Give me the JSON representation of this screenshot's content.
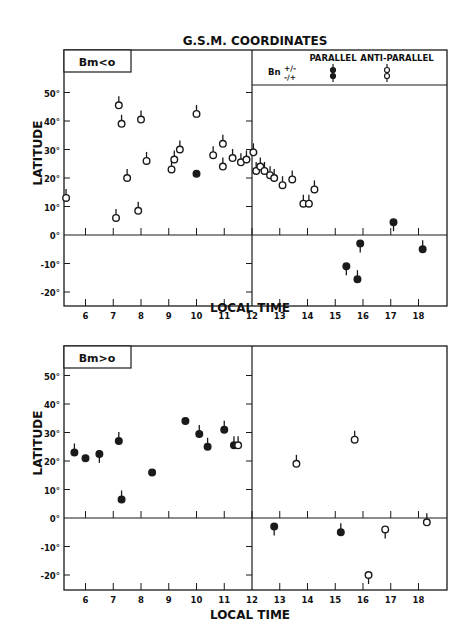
{
  "title": "G.S.M. COORDINATES",
  "legend": {
    "header_parallel": "PARALLEL",
    "header_antiparallel": "ANTI-PARALLEL",
    "bn_label": "Bn",
    "row1_sign": "+/-",
    "row2_sign": "-/+"
  },
  "chart_data": [
    {
      "type": "scatter",
      "panel_label": "Bm < o",
      "xlabel": "LOCAL TIME",
      "ylabel": "LATITUDE",
      "xlim": [
        5.2,
        19.0
      ],
      "ylim": [
        -25,
        58
      ],
      "xticks": [
        6,
        7,
        8,
        9,
        10,
        11,
        12,
        13,
        14,
        15,
        16,
        17,
        18
      ],
      "yticks": [
        50,
        40,
        30,
        20,
        10,
        0,
        -10,
        -20
      ],
      "ytick_labels": [
        "50°",
        "40°",
        "30°",
        "20°",
        "10°",
        "0°",
        "-10°",
        "-20°"
      ],
      "grid": false,
      "series": [
        {
          "name": "ANTI-PARALLEL",
          "marker": "open",
          "points": [
            {
              "x": 5.3,
              "y": 13,
              "stem": "up"
            },
            {
              "x": 7.1,
              "y": 6,
              "stem": "up"
            },
            {
              "x": 7.2,
              "y": 45.5,
              "stem": "up"
            },
            {
              "x": 7.3,
              "y": 39,
              "stem": "up"
            },
            {
              "x": 7.5,
              "y": 20,
              "stem": "up"
            },
            {
              "x": 7.9,
              "y": 8.5,
              "stem": "up"
            },
            {
              "x": 8.0,
              "y": 40.5,
              "stem": "up"
            },
            {
              "x": 8.2,
              "y": 26,
              "stem": "up"
            },
            {
              "x": 9.1,
              "y": 23,
              "stem": "up"
            },
            {
              "x": 9.2,
              "y": 26.5,
              "stem": "up"
            },
            {
              "x": 9.4,
              "y": 30,
              "stem": "up"
            },
            {
              "x": 10.0,
              "y": 42.5,
              "stem": "up"
            },
            {
              "x": 10.6,
              "y": 28,
              "stem": "up"
            },
            {
              "x": 10.95,
              "y": 32,
              "stem": "up"
            },
            {
              "x": 10.95,
              "y": 24,
              "stem": "up"
            },
            {
              "x": 11.3,
              "y": 27,
              "stem": "up"
            },
            {
              "x": 11.6,
              "y": 25.5,
              "stem": "up"
            },
            {
              "x": 11.8,
              "y": 26.5,
              "stem": "up"
            },
            {
              "x": 12.05,
              "y": 29,
              "stem": "up"
            },
            {
              "x": 12.15,
              "y": 22.5,
              "stem": "up"
            },
            {
              "x": 12.3,
              "y": 24,
              "stem": "up"
            },
            {
              "x": 12.45,
              "y": 22.5,
              "stem": "up"
            },
            {
              "x": 12.65,
              "y": 21,
              "stem": "up"
            },
            {
              "x": 12.8,
              "y": 20,
              "stem": "up"
            },
            {
              "x": 13.1,
              "y": 17.5,
              "stem": "up"
            },
            {
              "x": 13.45,
              "y": 19.5,
              "stem": "up"
            },
            {
              "x": 13.85,
              "y": 11,
              "stem": "up"
            },
            {
              "x": 14.05,
              "y": 11,
              "stem": "up"
            },
            {
              "x": 14.25,
              "y": 16,
              "stem": "up"
            }
          ]
        },
        {
          "name": "PARALLEL",
          "marker": "filled",
          "points": [
            {
              "x": 10.0,
              "y": 21.5,
              "stem": "none"
            },
            {
              "x": 17.1,
              "y": 4.5,
              "stem": "down"
            },
            {
              "x": 15.4,
              "y": -11,
              "stem": "down"
            },
            {
              "x": 15.8,
              "y": -15.5,
              "stem": "up"
            },
            {
              "x": 15.9,
              "y": -3,
              "stem": "down"
            },
            {
              "x": 18.15,
              "y": -5,
              "stem": "up"
            }
          ]
        }
      ]
    },
    {
      "type": "scatter",
      "panel_label": "Bm > o",
      "xlabel": "LOCAL TIME",
      "ylabel": "LATITUDE",
      "xlim": [
        5.2,
        19.0
      ],
      "ylim": [
        -25,
        58
      ],
      "xticks": [
        6,
        7,
        8,
        9,
        10,
        11,
        12,
        13,
        14,
        15,
        16,
        17,
        18
      ],
      "yticks": [
        50,
        40,
        30,
        20,
        10,
        0,
        -10,
        -20
      ],
      "ytick_labels": [
        "50°",
        "40°",
        "30°",
        "20°",
        "10°",
        "0°",
        "-10°",
        "-20°"
      ],
      "grid": false,
      "series": [
        {
          "name": "PARALLEL",
          "marker": "filled",
          "points": [
            {
              "x": 5.6,
              "y": 23,
              "stem": "up"
            },
            {
              "x": 6.0,
              "y": 21,
              "stem": "none"
            },
            {
              "x": 6.5,
              "y": 22.5,
              "stem": "down"
            },
            {
              "x": 7.2,
              "y": 27,
              "stem": "up"
            },
            {
              "x": 7.3,
              "y": 6.5,
              "stem": "up"
            },
            {
              "x": 8.4,
              "y": 16,
              "stem": "none"
            },
            {
              "x": 9.6,
              "y": 34,
              "stem": "none"
            },
            {
              "x": 10.1,
              "y": 29.5,
              "stem": "up"
            },
            {
              "x": 10.4,
              "y": 25,
              "stem": "up"
            },
            {
              "x": 11.0,
              "y": 31,
              "stem": "up"
            },
            {
              "x": 11.35,
              "y": 25.5,
              "stem": "up"
            },
            {
              "x": 12.8,
              "y": -3,
              "stem": "down"
            },
            {
              "x": 15.2,
              "y": -5,
              "stem": "up"
            }
          ]
        },
        {
          "name": "ANTI-PARALLEL",
          "marker": "open",
          "points": [
            {
              "x": 11.5,
              "y": 25.5,
              "stem": "up"
            },
            {
              "x": 13.6,
              "y": 19,
              "stem": "up"
            },
            {
              "x": 15.7,
              "y": 27.5,
              "stem": "up"
            },
            {
              "x": 16.2,
              "y": -20,
              "stem": "down"
            },
            {
              "x": 16.8,
              "y": -4,
              "stem": "down"
            },
            {
              "x": 18.3,
              "y": -1.5,
              "stem": "up"
            }
          ]
        }
      ]
    }
  ]
}
